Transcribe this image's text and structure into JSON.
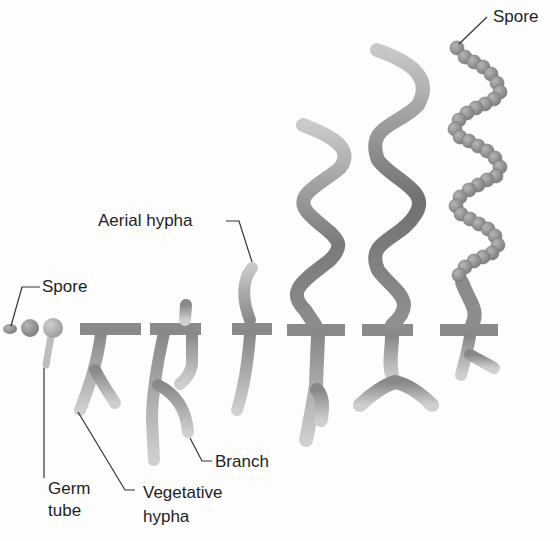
{
  "labels": {
    "spore_top": "Spore",
    "spore_left": "Spore",
    "aerial_hypha": "Aerial hypha",
    "branch": "Branch",
    "germ_tube": [
      "Germ",
      "tube"
    ],
    "vegetative_hypha": [
      "Vegetative",
      "hypha"
    ]
  },
  "stages": [
    {
      "index": 1,
      "name": "spore"
    },
    {
      "index": 2,
      "name": "swollen spore"
    },
    {
      "index": 3,
      "name": "germ tube"
    },
    {
      "index": 4,
      "name": "vegetative hypha"
    },
    {
      "index": 5,
      "name": "branched vegetative mycelium"
    },
    {
      "index": 6,
      "name": "aerial hypha emerging"
    },
    {
      "index": 7,
      "name": "aerial hypha growing"
    },
    {
      "index": 8,
      "name": "mature aerial hypha"
    },
    {
      "index": 9,
      "name": "spore chain"
    }
  ],
  "colors": {
    "hypha_light": "#c4c4c4",
    "hypha_mid": "#9a9a9a",
    "hypha_dark": "#777777",
    "spore": "#8f8f8f",
    "leader": "#333333",
    "text": "#1e1e1e"
  }
}
